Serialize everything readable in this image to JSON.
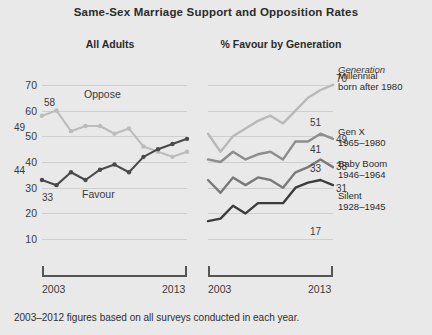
{
  "title": "Same-Sex Marriage Support and Opposition Rates",
  "panels": {
    "left": {
      "heading": "All Adults"
    },
    "right": {
      "heading": "% Favour by Generation"
    }
  },
  "axis": {
    "x_start": "2003",
    "x_end": "2013",
    "y_ticks": [
      "70",
      "60",
      "50",
      "40",
      "30",
      "20",
      "10"
    ]
  },
  "legend": {
    "title": "Generation",
    "items": [
      {
        "name": "Millennial",
        "years": "born after 1980",
        "color": "#b9b9b9"
      },
      {
        "name": "Gen X",
        "years": "1965–1980",
        "color": "#8d8d8d"
      },
      {
        "name": "Baby Boom",
        "years": "1946–1964",
        "color": "#7a7a7a"
      },
      {
        "name": "Silent",
        "years": "1928–1945",
        "color": "#3c3c3c"
      }
    ]
  },
  "footnote": "2003–2012 figures based on all surveys conducted in each year.",
  "inline_labels": {
    "oppose": "Oppose",
    "favour": "Favour"
  },
  "end_labels": {
    "left_oppose_start": "58",
    "left_favour_start": "33",
    "left_favour_end": "49",
    "left_oppose_end": "44",
    "right_millennial_start": "51",
    "right_millennial_end": "70",
    "right_genx_start": "41",
    "right_genx_end": "49",
    "right_boom_start": "33",
    "right_boom_end": "38",
    "right_silent_start": "17",
    "right_silent_end": "31"
  },
  "colors": {
    "background": "#e9e9e9",
    "grid": "#cfcfcf",
    "dark_line": "#4a4a4a",
    "light_line": "#bcbcbc",
    "text": "#2b2b2b"
  },
  "chart_data": {
    "type": "line",
    "title": "Same-Sex Marriage Support and Opposition Rates",
    "xlabel": "",
    "ylabel": "%",
    "ylim": [
      5,
      75
    ],
    "grid": true,
    "legend_position": "right",
    "panels": [
      {
        "name": "All Adults",
        "x": [
          2003,
          2004,
          2005,
          2006,
          2007,
          2008,
          2009,
          2010,
          2011,
          2012,
          2013
        ],
        "series": [
          {
            "name": "Oppose",
            "color": "#bcbcbc",
            "values": [
              58,
              60,
              52,
              54,
              54,
              51,
              53,
              46,
              44,
              42,
              44
            ],
            "start_label": 58,
            "end_label": 44
          },
          {
            "name": "Favour",
            "color": "#4a4a4a",
            "values": [
              33,
              31,
              36,
              33,
              37,
              39,
              36,
              42,
              45,
              47,
              49
            ],
            "start_label": 33,
            "end_label": 49
          }
        ]
      },
      {
        "name": "% Favour by Generation",
        "x": [
          2003,
          2004,
          2005,
          2006,
          2007,
          2008,
          2009,
          2010,
          2011,
          2012,
          2013
        ],
        "series": [
          {
            "name": "Millennial",
            "sub": "born after 1980",
            "color": "#b9b9b9",
            "values": [
              51,
              44,
              50,
              53,
              56,
              58,
              55,
              60,
              65,
              68,
              70
            ],
            "start_label": 51,
            "end_label": 70
          },
          {
            "name": "Gen X",
            "sub": "1965–1980",
            "color": "#8d8d8d",
            "values": [
              41,
              40,
              44,
              41,
              43,
              44,
              41,
              48,
              48,
              51,
              49
            ],
            "start_label": 41,
            "end_label": 49
          },
          {
            "name": "Baby Boom",
            "sub": "1946–1964",
            "color": "#7a7a7a",
            "values": [
              33,
              28,
              34,
              31,
              34,
              33,
              30,
              36,
              38,
              41,
              38
            ],
            "start_label": 33,
            "end_label": 38
          },
          {
            "name": "Silent",
            "sub": "1928–1945",
            "color": "#3c3c3c",
            "values": [
              17,
              18,
              23,
              20,
              24,
              24,
              24,
              30,
              32,
              33,
              31
            ],
            "start_label": 17,
            "end_label": 31
          }
        ]
      }
    ]
  }
}
